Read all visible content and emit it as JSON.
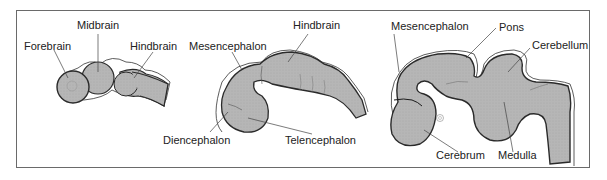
{
  "figure": {
    "panels": [
      {
        "stage": "early",
        "labels": {
          "forebrain": "Forebrain",
          "midbrain": "Midbrain",
          "hindbrain": "Hindbrain"
        }
      },
      {
        "stage": "middle",
        "labels": {
          "mesencephalon": "Mesencephalon",
          "hindbrain": "Hindbrain",
          "diencephalon": "Diencephalon",
          "telencephalon": "Telencephalon"
        }
      },
      {
        "stage": "late",
        "labels": {
          "mesencephalon": "Mesencephalon",
          "pons": "Pons",
          "cerebellum": "Cerebellum",
          "cerebrum": "Cerebrum",
          "medulla": "Medulla"
        }
      }
    ],
    "colors": {
      "tissue_fill": "#b4b4b4",
      "outline": "#2a2a2a",
      "frame": "#6a6a6a",
      "leader_line": "#444444"
    }
  }
}
